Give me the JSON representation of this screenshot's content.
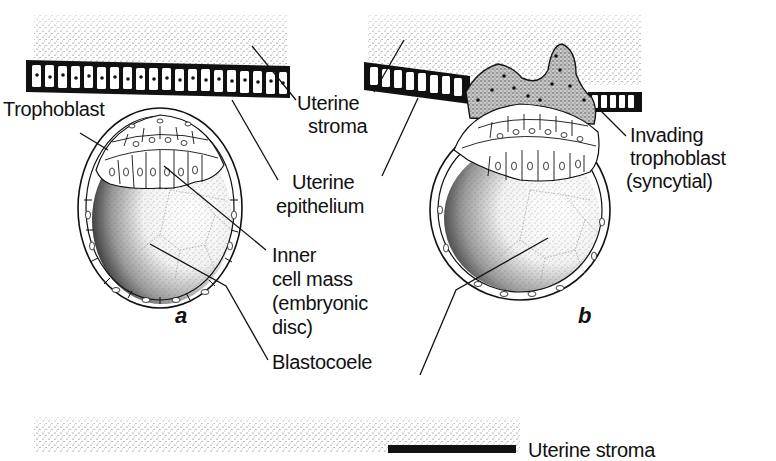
{
  "figure": {
    "panels": [
      {
        "id": "a",
        "letter": "a"
      },
      {
        "id": "b",
        "letter": "b"
      }
    ],
    "labels": {
      "trophoblast": "Trophoblast",
      "uterine_stroma_line1": "Uterine",
      "uterine_stroma_line2": "stroma",
      "uterine_epithelium_line1": "Uterine",
      "uterine_epithelium_line2": "epithelium",
      "inner_cell_mass_line1": "Inner",
      "inner_cell_mass_line2": "cell mass",
      "inner_cell_mass_line3": "(embryonic",
      "inner_cell_mass_line4": " disc)",
      "blastocoele": "Blastocoele",
      "invading_line1": "Invading",
      "invading_line2": "trophoblast",
      "invading_line3": "(syncytial)",
      "bottom_uterine_stroma": "Uterine stroma"
    }
  }
}
